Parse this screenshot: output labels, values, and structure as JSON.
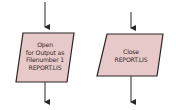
{
  "diagram": {
    "type": "flowchart-fragment",
    "colors": {
      "fill": "#e8c9c9",
      "stroke": "#2e2424",
      "text": "#3a2a2a"
    },
    "nodes": [
      {
        "id": "open",
        "shape": "parallelogram",
        "lines": [
          "Open",
          "for Output as",
          "Filenumber 1",
          "REPORT.LIS"
        ]
      },
      {
        "id": "close",
        "shape": "parallelogram",
        "lines": [
          "Close",
          "REPORT.LIS"
        ]
      }
    ],
    "edges": [
      {
        "to": "open",
        "direction": "in-from-top"
      },
      {
        "from": "open",
        "direction": "out-to-bottom"
      },
      {
        "to": "close",
        "direction": "in-from-top"
      },
      {
        "from": "close",
        "direction": "out-to-bottom"
      }
    ]
  }
}
